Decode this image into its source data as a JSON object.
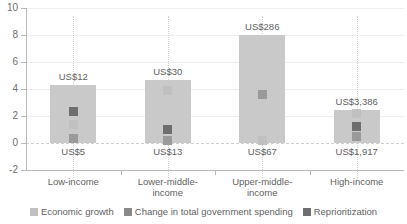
{
  "chart_data": {
    "type": "bar",
    "title": "",
    "xlabel": "",
    "ylabel": "",
    "ylim": [
      -2,
      10
    ],
    "grid": true,
    "legend_position": "bottom",
    "categories": [
      "Low-income",
      "Lower-middle-\nincome",
      "Upper-middle-\nincome",
      "High-income"
    ],
    "ytick_labels": [
      "10",
      "8",
      "6",
      "4",
      "2",
      "0",
      "-2"
    ],
    "ytick_values": [
      10,
      8,
      6,
      4,
      2,
      0,
      -2
    ],
    "bars": {
      "name": "Total change",
      "values": [
        4.3,
        4.7,
        8.0,
        2.45
      ]
    },
    "top_value_labels": [
      "US$12",
      "US$30",
      "US$286",
      "US$3,386"
    ],
    "bottom_value_labels": [
      "US$5",
      "US$13",
      "US$67",
      "US$1,917"
    ],
    "series": [
      {
        "name": "Economic growth",
        "color": "#c0c0c0",
        "values": [
          1.4,
          3.9,
          0.2,
          2.2
        ]
      },
      {
        "name": "Change in total government spending",
        "color": "#6e6e6e",
        "values": [
          2.3,
          1.0,
          3.6,
          1.2
        ]
      },
      {
        "name": "Reprioritization",
        "color": "#9a9a9a",
        "values": [
          0.3,
          0.2,
          3.6,
          0.45
        ]
      }
    ],
    "legend": [
      "Economic growth",
      "Change in total government spending",
      "Reprioritization"
    ]
  },
  "top_caption": ""
}
